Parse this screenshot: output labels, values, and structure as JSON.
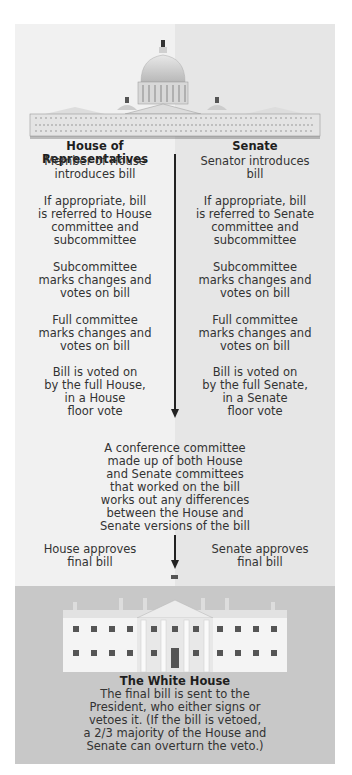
{
  "diagram": {
    "colors": {
      "house_bg": "#f1f1f1",
      "senate_bg": "#e6e6e6",
      "white_house_bg": "#c8c8c8",
      "arrow": "#222222"
    },
    "house": {
      "header": "House of Representatives",
      "steps": [
        [
          "Member of House",
          "introduces bill"
        ],
        [
          "If appropriate, bill",
          "is referred to House",
          "committee and",
          "subcommittee"
        ],
        [
          "Subcommittee",
          "marks changes and",
          "votes on bill"
        ],
        [
          "Full committee",
          "marks changes and",
          "votes on bill"
        ],
        [
          "Bill is voted on",
          "by the full House,",
          "in a House",
          "floor vote"
        ]
      ],
      "final": [
        "House approves",
        "final bill"
      ]
    },
    "senate": {
      "header": "Senate",
      "steps": [
        [
          "Senator introduces",
          "bill"
        ],
        [
          "If appropriate, bill",
          "is referred to Senate",
          "committee and",
          "subcommittee"
        ],
        [
          "Subcommittee",
          "marks changes and",
          "votes on bill"
        ],
        [
          "Full committee",
          "marks changes and",
          "votes on bill"
        ],
        [
          "Bill is voted on",
          "by the full Senate,",
          "in a Senate",
          "floor vote"
        ]
      ],
      "final": [
        "Senate approves",
        "final bill"
      ]
    },
    "conference": [
      "A conference committee",
      "made up of both House",
      "and Senate committees",
      "that worked on the bill",
      "works out any differences",
      "between the House and",
      "Senate versions of the bill"
    ],
    "white_house": {
      "title": "The White House",
      "text": [
        "The final bill is sent to the",
        "President, who either signs or",
        "vetoes it. (If the bill is vetoed,",
        "a 2/3 majority of the House and",
        "Senate can overturn the veto.)"
      ]
    },
    "icons": {
      "capitol": "capitol-building-illustration",
      "white_house": "white-house-illustration"
    }
  }
}
